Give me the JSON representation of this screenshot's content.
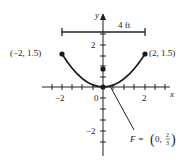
{
  "figure": {
    "axes": {
      "x_label": "x",
      "y_label": "y",
      "x_tick_labels": [
        {
          "value": -2,
          "text": "−2"
        },
        {
          "value": 0,
          "text": "0"
        },
        {
          "value": 2,
          "text": "2"
        }
      ],
      "y_tick_labels": [
        {
          "value": 2,
          "text": "2"
        },
        {
          "value": -2,
          "text": "−2"
        }
      ]
    },
    "width_marker": {
      "label": "4 ft"
    },
    "points": {
      "left": {
        "label": "(−2, 1.5)",
        "x": -2,
        "y": 1.5
      },
      "right": {
        "label": "(2, 1.5)",
        "x": 2,
        "y": 1.5
      },
      "vertex": {
        "x": 0,
        "y": 0
      },
      "focus": {
        "x": 0,
        "y": 0.6667
      }
    },
    "focus_label": {
      "prefix": "F = ",
      "open": "(",
      "x_value": "0,",
      "numerator": "2",
      "denominator": "3",
      "close": ")"
    },
    "curve": {
      "equation_hint": "parabola opening upward through (−2, 1.5), (0, 0), (2, 1.5)",
      "color": "#1a1a1a"
    }
  }
}
